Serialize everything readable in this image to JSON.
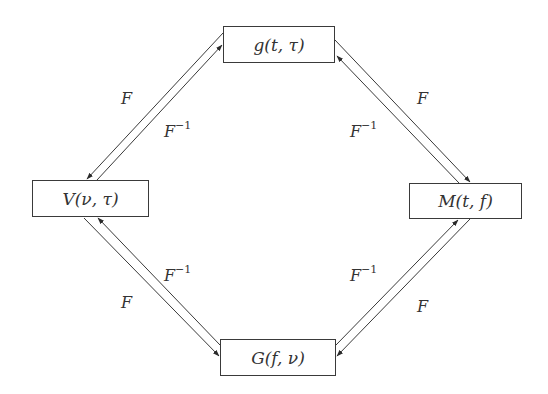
{
  "diagram": {
    "nodes": {
      "top": {
        "label": "g(t, τ)",
        "x": 223,
        "y": 26,
        "w": 112,
        "h": 37
      },
      "left": {
        "label": "V(ν, τ)",
        "x": 32,
        "y": 180,
        "w": 117,
        "h": 37
      },
      "right": {
        "label": "M(t, f)",
        "x": 409,
        "y": 183,
        "w": 113,
        "h": 36
      },
      "bottom": {
        "label": "G(f, ν)",
        "x": 220,
        "y": 339,
        "w": 116,
        "h": 37
      }
    },
    "edges": [
      {
        "from": "top",
        "to": "left",
        "label": "F"
      },
      {
        "from": "left",
        "to": "top",
        "label": "F",
        "superscript": "−1"
      },
      {
        "from": "top",
        "to": "right",
        "label": "F"
      },
      {
        "from": "right",
        "to": "top",
        "label": "F",
        "superscript": "−1"
      },
      {
        "from": "left",
        "to": "bottom",
        "label": "F"
      },
      {
        "from": "bottom",
        "to": "left",
        "label": "F",
        "superscript": "−1"
      },
      {
        "from": "right",
        "to": "bottom",
        "label": "F"
      },
      {
        "from": "bottom",
        "to": "right",
        "label": "F",
        "superscript": "−1"
      }
    ],
    "labels": {
      "tl_forward": "F",
      "tl_inverse": "F",
      "tl_inverse_sup": "−1",
      "tr_forward": "F",
      "tr_inverse": "F",
      "tr_inverse_sup": "−1",
      "bl_forward": "F",
      "bl_inverse": "F",
      "bl_inverse_sup": "−1",
      "br_forward": "F",
      "br_inverse": "F",
      "br_inverse_sup": "−1"
    },
    "line_color": "#3a3a3a"
  }
}
